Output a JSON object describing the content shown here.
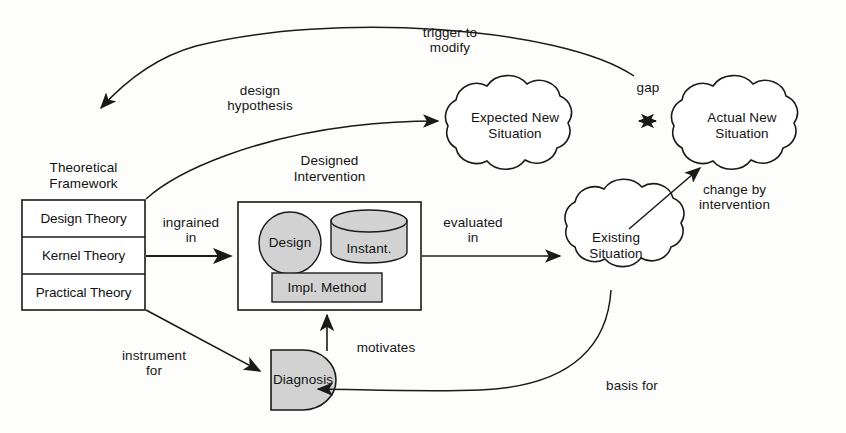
{
  "diagram": {
    "style": {
      "stroke": "#1a1a1a",
      "shape_fill": "#d2d2d2",
      "background": "#fdfdfc",
      "cloud_fill": "#ffffff"
    },
    "nodes": {
      "theoretical_framework": {
        "header": "Theoretical\nFramework",
        "rows": [
          {
            "label": "Design Theory"
          },
          {
            "label": "Kernel Theory"
          },
          {
            "label": "Practical Theory"
          }
        ]
      },
      "designed_intervention": {
        "header": "Designed\nIntervention",
        "parts": [
          {
            "label": "Design",
            "shape": "circle"
          },
          {
            "label": "Instant.",
            "shape": "cylinder"
          },
          {
            "label": "Impl. Method",
            "shape": "rectangle"
          }
        ]
      },
      "diagnosis": {
        "label": "Diagnosis",
        "shape": "d-shape"
      },
      "existing_situation": {
        "label": "Existing\nSituation",
        "shape": "cloud"
      },
      "expected_new_situation": {
        "label": "Expected New\nSituation",
        "shape": "cloud"
      },
      "actual_new_situation": {
        "label": "Actual New\nSituation",
        "shape": "cloud"
      }
    },
    "edges": [
      {
        "id": "trigger",
        "label": "trigger to\nmodify",
        "from": "gap",
        "to": "theoretical_framework"
      },
      {
        "id": "hypothesis",
        "label": "design\nhypothesis",
        "from": "theoretical_framework",
        "to": "expected_new_situation"
      },
      {
        "id": "ingrained",
        "label": "ingrained\nin",
        "from": "theoretical_framework",
        "to": "designed_intervention"
      },
      {
        "id": "evaluated",
        "label": "evaluated\nin",
        "from": "designed_intervention",
        "to": "existing_situation"
      },
      {
        "id": "gap",
        "label": "gap",
        "from": "expected_new_situation",
        "to": "actual_new_situation"
      },
      {
        "id": "change",
        "label": "change by\nintervention",
        "from": "existing_situation",
        "to": "actual_new_situation"
      },
      {
        "id": "basis",
        "label": "basis for",
        "from": "existing_situation",
        "to": "diagnosis"
      },
      {
        "id": "motivates",
        "label": "motivates",
        "from": "diagnosis",
        "to": "designed_intervention"
      },
      {
        "id": "instrument",
        "label": "instrument\nfor",
        "from": "theoretical_framework",
        "to": "diagnosis"
      }
    ]
  }
}
